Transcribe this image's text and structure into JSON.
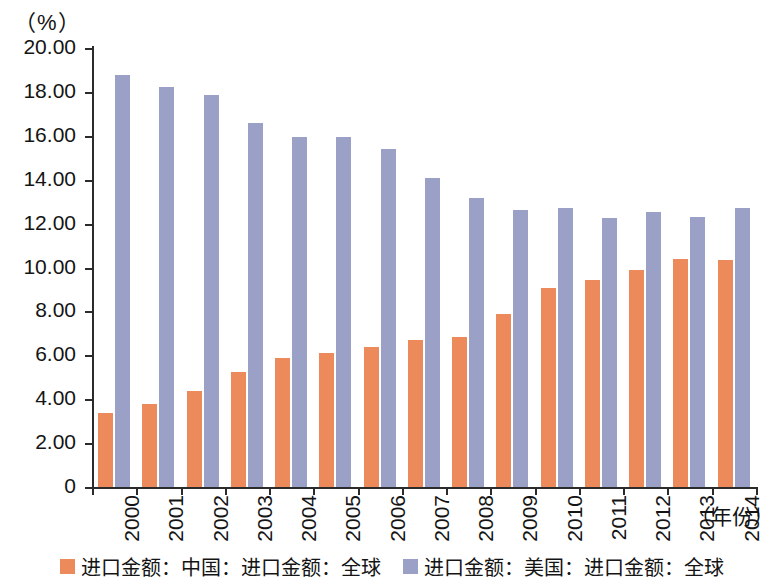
{
  "chart_data": {
    "type": "bar",
    "title": "",
    "subtitle": "",
    "unit_label": "（%）",
    "xlabel": "（年份）",
    "ylabel": "",
    "grid": false,
    "legend_position": "bottom",
    "ylim": [
      0,
      20
    ],
    "yticks": [
      0,
      2,
      4,
      6,
      8,
      10,
      12,
      14,
      16,
      18,
      20
    ],
    "ytick_labels": [
      "0",
      "2.00",
      "4.00",
      "6.00",
      "8.00",
      "10.00",
      "12.00",
      "14.00",
      "16.00",
      "18.00",
      "20.00"
    ],
    "categories": [
      "2000",
      "2001",
      "2002",
      "2003",
      "2004",
      "2005",
      "2006",
      "2007",
      "2008",
      "2009",
      "2010",
      "2011",
      "2012",
      "2013",
      "2014"
    ],
    "series": [
      {
        "name": "进口金额：中国：进口金额：全球",
        "color": "#ec8a5c",
        "values": [
          3.35,
          3.78,
          4.38,
          5.25,
          5.87,
          6.12,
          6.38,
          6.72,
          6.82,
          7.9,
          9.06,
          9.45,
          9.9,
          10.41,
          10.32
        ]
      },
      {
        "name": "进口金额：美国：进口金额：全球",
        "color": "#9ba1c6",
        "values": [
          18.78,
          18.24,
          17.85,
          16.58,
          15.95,
          15.93,
          15.4,
          14.1,
          13.15,
          12.62,
          12.7,
          12.25,
          12.55,
          12.3,
          12.7
        ]
      }
    ]
  },
  "legend": {
    "items": [
      {
        "label": "进口金额：中国：进口金额：全球",
        "color": "#ec8a5c"
      },
      {
        "label": "进口金额：美国：进口金额：全球",
        "color": "#9ba1c6"
      }
    ]
  }
}
